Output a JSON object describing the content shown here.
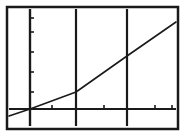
{
  "figure": {
    "title": "",
    "caption": "",
    "background_color": "#ffffff",
    "ink_color": "#1a1a1a",
    "frame": {
      "name": "plot-frame",
      "x": 7,
      "y": 7,
      "width": 171,
      "height": 122,
      "stroke_width": 2.5,
      "color": "#1a1a1a"
    }
  },
  "chart_data": {
    "type": "line",
    "title": "",
    "subtitle": "",
    "xlabel": "",
    "ylabel": "",
    "grid": true,
    "legend": null,
    "legend_position": "none",
    "axis_style": "calculator-screen",
    "xlim": [
      -0.35,
      3.55
    ],
    "ylim": [
      -0.35,
      3.05
    ],
    "x_axis": {
      "name": "x-axis",
      "pixel_y": 109,
      "x_start_px": 9,
      "x_end_px": 176,
      "tick_values": [
        0.5,
        1.5,
        2.5,
        3.5
      ],
      "tick_labels": [
        "",
        "",
        "",
        ""
      ],
      "tick_pixel_x": [
        52,
        104,
        155,
        172
      ],
      "tick_direction": "up",
      "tick_length_px": 4
    },
    "y_axis": {
      "name": "y-axis",
      "pixel_x": 30,
      "y_start_px": 9,
      "y_end_px": 126,
      "tick_values": [
        0.5,
        1.0,
        1.5,
        2.0,
        2.5
      ],
      "tick_labels": [
        "",
        "",
        "",
        "",
        ""
      ],
      "tick_pixel_y": [
        92,
        72,
        52,
        32,
        18
      ],
      "tick_direction": "right",
      "tick_length_px": 4
    },
    "vertical_gridlines": {
      "name": "vertical-gridlines",
      "values": [
        0,
        1,
        2
      ],
      "pixel_x": [
        30,
        76,
        127
      ],
      "stroke_width": 2.2,
      "top_px": 9,
      "bottom_px": 126
    },
    "series": [
      {
        "name": "line-1",
        "style": "solid",
        "stroke_width": 1.6,
        "color": "#1a1a1a",
        "points_pixel": [
          [
            9,
            116
          ],
          [
            30,
            109
          ],
          [
            76,
            92
          ],
          [
            127,
            56
          ],
          [
            176,
            22
          ]
        ],
        "x": [
          -0.42,
          0.0,
          1.0,
          2.0,
          3.0
        ],
        "y": [
          -0.12,
          0.0,
          0.52,
          1.6,
          2.62
        ],
        "approx_equation": "y ≈ 0.88x",
        "slope": 0.88,
        "intercept": 0.0
      }
    ],
    "annotations": []
  }
}
